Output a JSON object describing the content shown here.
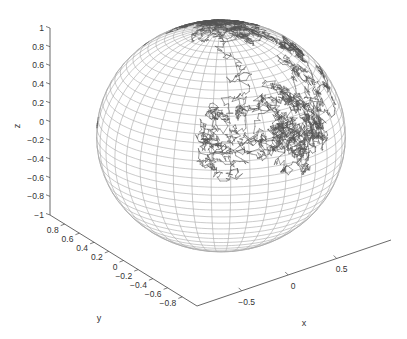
{
  "chart_data": {
    "type": "scatter3d",
    "title": "",
    "xlabel": "x",
    "ylabel": "y",
    "zlabel": "z",
    "xlim": [
      -1,
      1
    ],
    "ylim": [
      -1,
      1
    ],
    "zlim": [
      -1,
      1
    ],
    "x_ticks": [
      "−0.5",
      "0",
      "0.5"
    ],
    "y_ticks": [
      "0.8",
      "0.6",
      "0.4",
      "0.2",
      "0",
      "−0.2",
      "−0.4",
      "−0.6",
      "−0.8"
    ],
    "z_ticks": [
      "1",
      "0.8",
      "0.6",
      "0.4",
      "0.2",
      "0",
      "−0.2",
      "−0.4",
      "−0.6",
      "−0.8",
      "−1"
    ],
    "grid": false,
    "legend": null,
    "series": [
      {
        "name": "sphere-mesh",
        "kind": "wireframe",
        "color": "#9a9a9a",
        "radius": 1
      },
      {
        "name": "random-walk-path",
        "kind": "line3d",
        "color": "#555555",
        "region": "upper hemisphere and left limb"
      }
    ]
  },
  "axes": {
    "z": {
      "label": "z",
      "ticks": [
        "1",
        "0.8",
        "0.6",
        "0.4",
        "0.2",
        "0",
        "−0.2",
        "−0.4",
        "−0.6",
        "−0.8",
        "−1"
      ]
    },
    "y": {
      "label": "y",
      "ticks": [
        "0.8",
        "0.6",
        "0.4",
        "0.2",
        "0",
        "−0.2",
        "−0.4",
        "−0.6",
        "−0.8"
      ]
    },
    "x": {
      "label": "x",
      "ticks": [
        "−0.5",
        "0",
        "0.5"
      ]
    }
  },
  "colors": {
    "axis": "#444444",
    "mesh": "#a8a8a8",
    "path": "#555555",
    "text": "#333333"
  }
}
